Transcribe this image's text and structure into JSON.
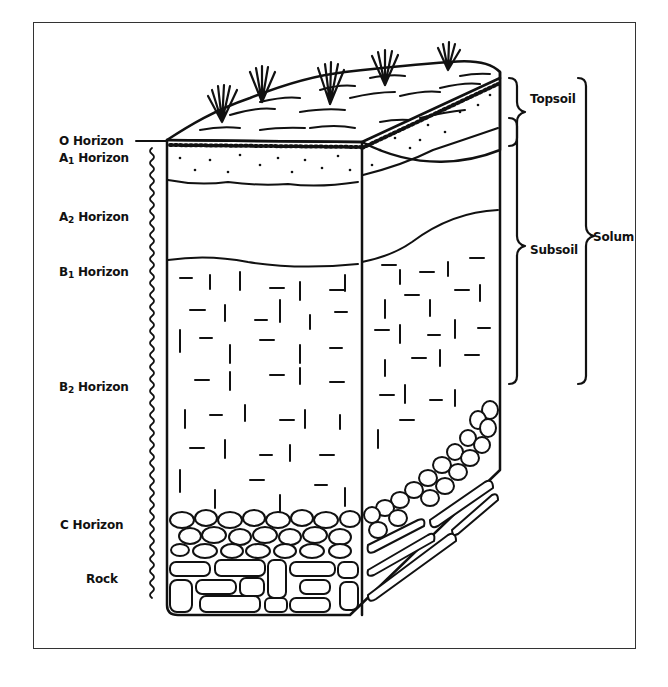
{
  "diagram": {
    "type": "soil-profile-cross-section",
    "horizons": [
      {
        "id": "O",
        "prefix": "O",
        "sub": "",
        "suffix": " Horizon"
      },
      {
        "id": "A1",
        "prefix": "A",
        "sub": "1",
        "suffix": " Horizon"
      },
      {
        "id": "A2",
        "prefix": "A",
        "sub": "2",
        "suffix": " Horizon"
      },
      {
        "id": "B1",
        "prefix": "B",
        "sub": "1",
        "suffix": " Horizon"
      },
      {
        "id": "B2",
        "prefix": "B",
        "sub": "2",
        "suffix": " Horizon"
      },
      {
        "id": "C",
        "prefix": "C",
        "sub": "",
        "suffix": " Horizon"
      },
      {
        "id": "rock",
        "prefix": "Rock",
        "sub": "",
        "suffix": ""
      }
    ],
    "brackets": {
      "topsoil": "Topsoil",
      "subsoil": "Subsoil",
      "solum": "Solum"
    },
    "colors": {
      "ink": "#111111",
      "frame": "#333333",
      "background": "#ffffff"
    }
  }
}
